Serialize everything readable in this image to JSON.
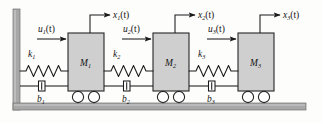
{
  "figure": {
    "kind": "mechanical-schematic",
    "colors": {
      "mass_fill": "#cfcfcf",
      "mass_stroke": "#262626",
      "wall_fill": "#a8a8a8",
      "ground_fill": "#a8a8a8",
      "line": "#1a1a1a",
      "background": "#fdfdfc"
    }
  },
  "masses": [
    {
      "label": "M",
      "sub": "1",
      "name": "mass-1"
    },
    {
      "label": "M",
      "sub": "2",
      "name": "mass-2"
    },
    {
      "label": "M",
      "sub": "3",
      "name": "mass-3"
    }
  ],
  "springs": [
    {
      "label": "k",
      "sub": "1",
      "name": "spring-k1"
    },
    {
      "label": "k",
      "sub": "2",
      "name": "spring-k2"
    },
    {
      "label": "k",
      "sub": "3",
      "name": "spring-k3"
    }
  ],
  "dampers": [
    {
      "label": "b",
      "sub": "1",
      "name": "damper-b1"
    },
    {
      "label": "b",
      "sub": "2",
      "name": "damper-b2"
    },
    {
      "label": "b",
      "sub": "3",
      "name": "damper-b3"
    }
  ],
  "inputs": [
    {
      "label": "u",
      "sub": "1",
      "suffix": "(t)",
      "name": "input-force-u1"
    },
    {
      "label": "u",
      "sub": "2",
      "suffix": "(t)",
      "name": "input-force-u2"
    },
    {
      "label": "u",
      "sub": "3",
      "suffix": "(t)",
      "name": "input-force-u3"
    }
  ],
  "outputs": [
    {
      "label": "x",
      "sub": "1",
      "suffix": "(t)",
      "name": "output-displacement-x1"
    },
    {
      "label": "x",
      "sub": "2",
      "suffix": "(t)",
      "name": "output-displacement-x2"
    },
    {
      "label": "x",
      "sub": "3",
      "suffix": "(t)",
      "name": "output-displacement-x3"
    }
  ],
  "structure": {
    "wall_label": "fixed-wall",
    "ground_label": "ground",
    "wheels_per_mass": 2
  }
}
